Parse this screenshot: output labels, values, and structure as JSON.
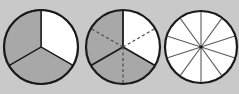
{
  "figure": {
    "background_color": "#c9c9c9",
    "title": "",
    "caption": ""
  },
  "chart_data": [
    {
      "type": "pie",
      "name": "thirds-circle",
      "title": "",
      "total_sectors": 3,
      "denominator": 3,
      "shaded_count": 2,
      "unshaded_count": 1,
      "fraction_shaded": "2/3",
      "fraction_unshaded": "1/3",
      "categories": [
        "sector-1",
        "sector-2",
        "sector-3"
      ],
      "values": [
        1,
        1,
        1
      ],
      "sector_fills": [
        "#ffffff",
        "#a8a8a8",
        "#a8a8a8"
      ],
      "start_angle_deg": 0,
      "sector_angle_deg": 120,
      "divider_style": "solid",
      "divider_count": 3,
      "has_dashed_subdivisions": false,
      "outline_color": "#1a1a1a",
      "shaded_color": "#a8a8a8",
      "unshaded_color": "#ffffff",
      "center_x": 41,
      "center_y": 47,
      "radius": 37
    },
    {
      "type": "pie",
      "name": "sixths-circle",
      "title": "",
      "total_sectors": 6,
      "denominator": 6,
      "shaded_count": 4,
      "unshaded_count": 2,
      "fraction_shaded": "4/6",
      "fraction_unshaded": "2/6",
      "categories": [
        "sector-1",
        "sector-2",
        "sector-3",
        "sector-4",
        "sector-5",
        "sector-6"
      ],
      "values": [
        1,
        1,
        1,
        1,
        1,
        1
      ],
      "sector_fills": [
        "#ffffff",
        "#ffffff",
        "#a8a8a8",
        "#a8a8a8",
        "#a8a8a8",
        "#a8a8a8"
      ],
      "start_angle_deg": 0,
      "sector_angle_deg": 60,
      "divider_style": "mixed",
      "solid_divider_count": 3,
      "dashed_divider_count": 3,
      "has_dashed_subdivisions": true,
      "dashed_divider_angles_deg": [
        60,
        180,
        300
      ],
      "solid_divider_angles_deg": [
        0,
        120,
        240
      ],
      "outline_color": "#1a1a1a",
      "shaded_color": "#a8a8a8",
      "unshaded_color": "#ffffff",
      "dash_color": "#4a4a4a",
      "center_x": 41,
      "center_y": 47,
      "radius": 37
    },
    {
      "type": "pie",
      "name": "tenths-circle",
      "title": "",
      "total_sectors": 10,
      "denominator": 10,
      "shaded_count": 0,
      "unshaded_count": 10,
      "fraction_shaded": "0/10",
      "fraction_unshaded": "10/10",
      "categories": [
        "sector-1",
        "sector-2",
        "sector-3",
        "sector-4",
        "sector-5",
        "sector-6",
        "sector-7",
        "sector-8",
        "sector-9",
        "sector-10"
      ],
      "values": [
        1,
        1,
        1,
        1,
        1,
        1,
        1,
        1,
        1,
        1
      ],
      "sector_fills": [
        "#ffffff",
        "#ffffff",
        "#ffffff",
        "#ffffff",
        "#ffffff",
        "#ffffff",
        "#ffffff",
        "#ffffff",
        "#ffffff",
        "#ffffff"
      ],
      "start_angle_deg": 0,
      "sector_angle_deg": 36,
      "divider_style": "solid",
      "divider_count": 10,
      "has_dashed_subdivisions": false,
      "outline_color": "#1a1a1a",
      "shaded_color": "#a8a8a8",
      "unshaded_color": "#ffffff",
      "spoke_color": "#5a5a5a",
      "center_x": 38,
      "center_y": 47,
      "radius": 36
    }
  ]
}
